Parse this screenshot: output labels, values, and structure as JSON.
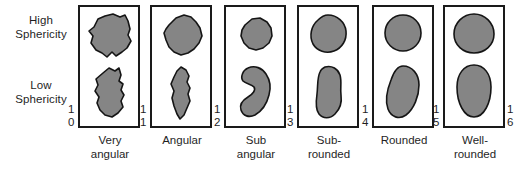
{
  "figure": {
    "type": "grain-roundness-sphericity-chart",
    "sphericity_labels": [
      {
        "id": "high",
        "line1": "High",
        "line2": "Sphericity"
      },
      {
        "id": "low",
        "line1": "Low",
        "line2": "Sphericity"
      }
    ],
    "columns": [
      {
        "id": "very-angular",
        "index_top": "1",
        "index_bottom": "0",
        "caption_line1": "Very",
        "caption_line2": "angular",
        "high_shape": "angular-blocky-high-sphericity",
        "low_shape": "angular-elongate-low-sphericity"
      },
      {
        "id": "angular",
        "index_top": "1",
        "index_bottom": "1",
        "caption_line1": "Angular",
        "caption_line2": "",
        "high_shape": "angular-subrounded-high-sphericity",
        "low_shape": "angular-tapered-low-sphericity"
      },
      {
        "id": "sub-angular",
        "index_top": "1",
        "index_bottom": "2",
        "caption_line1": "Sub",
        "caption_line2": "angular",
        "high_shape": "subangular-ovoid-high-sphericity",
        "low_shape": "subangular-kidney-low-sphericity"
      },
      {
        "id": "sub-rounded",
        "index_top": "1",
        "index_bottom": "3",
        "caption_line1": "Sub-",
        "caption_line2": "rounded",
        "high_shape": "subrounded-round-high-sphericity",
        "low_shape": "subrounded-elongate-low-sphericity"
      },
      {
        "id": "rounded",
        "index_top": "1",
        "index_bottom": "4",
        "caption_line1": "Rounded",
        "caption_line2": "",
        "high_shape": "rounded-circular-high-sphericity",
        "low_shape": "rounded-oblong-low-sphericity"
      },
      {
        "id": "well-rounded",
        "index_top": "1",
        "index_bottom": "5",
        "caption_line1": "Well-",
        "caption_line2": "rounded",
        "high_shape": "wellrounded-circular-high-sphericity",
        "low_shape": "wellrounded-ellipse-low-sphericity"
      }
    ],
    "trailing_index": {
      "index_top": "1",
      "index_bottom": "6"
    },
    "colors": {
      "grain_fill": "#858585",
      "grain_outline": "#151515",
      "box_border": "#1a1a1a",
      "background": "#ffffff",
      "text": "#1f1f1f"
    }
  }
}
